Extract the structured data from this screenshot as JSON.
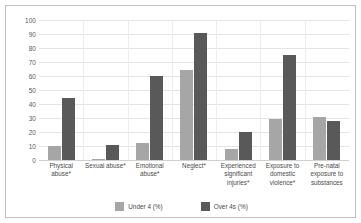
{
  "chart_data": {
    "type": "bar",
    "title": "",
    "xlabel": "",
    "ylabel": "",
    "ylim": [
      0,
      100
    ],
    "yticks": [
      0,
      10,
      20,
      30,
      40,
      50,
      60,
      70,
      80,
      90,
      100
    ],
    "grid": true,
    "legend_position": "bottom",
    "categories": [
      "Physical abuse*",
      "Sexual abuse*",
      "Emotional abuse*",
      "Neglect*",
      "Experienced significant injuries*",
      "Exposure to domestic violence*",
      "Pre-natal exposure to substances"
    ],
    "series": [
      {
        "name": "Under 4 (%)",
        "color": "#a6a6a6",
        "values": [
          10,
          1,
          12,
          64,
          8,
          29,
          31
        ]
      },
      {
        "name": "Over 4s (%)",
        "color": "#595959",
        "values": [
          44,
          11,
          60,
          91,
          20,
          75,
          28
        ]
      }
    ]
  },
  "legend": {
    "items": [
      {
        "label": "Under 4 (%)"
      },
      {
        "label": "Over 4s (%)"
      }
    ]
  }
}
